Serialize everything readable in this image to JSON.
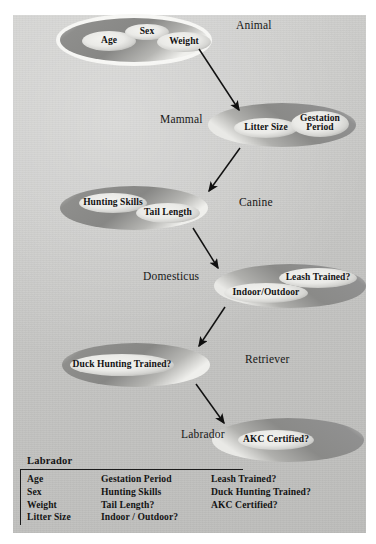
{
  "figure": {
    "background_color": "#c6c6c4",
    "panel_color": "#c9c9c7"
  },
  "classes": [
    {
      "id": "animal",
      "label": "Animal",
      "label_x": 236,
      "label_y": 19,
      "ellipse": {
        "cx": 134,
        "cy": 40,
        "rx": 74,
        "ry": 22
      },
      "has_outer_ring": true,
      "attributes": [
        {
          "name": "Age",
          "cx": 109,
          "cy": 41,
          "rx": 27,
          "ry": 10,
          "lines": [
            "Age"
          ]
        },
        {
          "name": "Sex",
          "cx": 147,
          "cy": 32,
          "rx": 22,
          "ry": 8,
          "lines": [
            "Sex"
          ]
        },
        {
          "name": "Weight",
          "cx": 184,
          "cy": 42,
          "rx": 27,
          "ry": 10,
          "lines": [
            "Weight"
          ]
        }
      ]
    },
    {
      "id": "mammal",
      "label": "Mammal",
      "label_x": 160,
      "label_y": 113,
      "ellipse": {
        "cx": 282,
        "cy": 125,
        "rx": 74,
        "ry": 22
      },
      "has_outer_ring": false,
      "attributes": [
        {
          "name": "Litter Size",
          "cx": 266,
          "cy": 128,
          "rx": 32,
          "ry": 10,
          "lines": [
            "Litter Size"
          ]
        },
        {
          "name": "Gestation Period",
          "cx": 320,
          "cy": 124,
          "rx": 29,
          "ry": 13,
          "lines": [
            "Gestation",
            "Period"
          ]
        }
      ]
    },
    {
      "id": "canine",
      "label": "Canine",
      "label_x": 239,
      "label_y": 196,
      "ellipse": {
        "cx": 134,
        "cy": 208,
        "rx": 74,
        "ry": 22
      },
      "has_outer_ring": false,
      "attributes": [
        {
          "name": "Hunting Skills",
          "cx": 113,
          "cy": 203,
          "rx": 34,
          "ry": 10,
          "lines": [
            "Hunting Skills"
          ]
        },
        {
          "name": "Tail Length",
          "cx": 168,
          "cy": 213,
          "rx": 32,
          "ry": 10,
          "lines": [
            "Tail Length"
          ]
        }
      ]
    },
    {
      "id": "domesticus",
      "label": "Domesticus",
      "label_x": 143,
      "label_y": 270,
      "ellipse": {
        "cx": 290,
        "cy": 286,
        "rx": 76,
        "ry": 22
      },
      "has_outer_ring": false,
      "attributes": [
        {
          "name": "Leash Trained?",
          "cx": 318,
          "cy": 278,
          "rx": 39,
          "ry": 10,
          "lines": [
            "Leash Trained?"
          ]
        },
        {
          "name": "Indoor/Outdoor",
          "cx": 266,
          "cy": 293,
          "rx": 42,
          "ry": 10,
          "lines": [
            "Indoor/Outdoor"
          ]
        }
      ]
    },
    {
      "id": "retriever",
      "label": "Retriever",
      "label_x": 245,
      "label_y": 353,
      "ellipse": {
        "cx": 136,
        "cy": 365,
        "rx": 74,
        "ry": 22
      },
      "has_outer_ring": false,
      "attributes": [
        {
          "name": "Duck Hunting Trained?",
          "cx": 122,
          "cy": 365,
          "rx": 52,
          "ry": 11,
          "lines": [
            "Duck Hunting Trained?"
          ]
        }
      ]
    },
    {
      "id": "labrador",
      "label": "Labrador",
      "label_x": 181,
      "label_y": 428,
      "ellipse": {
        "cx": 288,
        "cy": 440,
        "rx": 76,
        "ry": 22
      },
      "has_outer_ring": false,
      "attributes": [
        {
          "name": "AKC Certified?",
          "cx": 276,
          "cy": 440,
          "rx": 38,
          "ry": 10,
          "lines": [
            "AKC Certified?"
          ]
        }
      ]
    }
  ],
  "arrows": [
    {
      "from": "animal",
      "to": "mammal",
      "x1": 199,
      "y1": 49,
      "x2": 239,
      "y2": 110
    },
    {
      "from": "mammal",
      "to": "canine",
      "x1": 240,
      "y1": 148,
      "x2": 209,
      "y2": 191
    },
    {
      "from": "canine",
      "to": "domesticus",
      "x1": 193,
      "y1": 228,
      "x2": 218,
      "y2": 268
    },
    {
      "from": "domesticus",
      "to": "retriever",
      "x1": 225,
      "y1": 307,
      "x2": 199,
      "y2": 346
    },
    {
      "from": "retriever",
      "to": "labrador",
      "x1": 196,
      "y1": 384,
      "x2": 224,
      "y2": 423
    }
  ],
  "summary": {
    "title": "Labrador",
    "columns": [
      [
        "Age",
        "Sex",
        "Weight",
        "Litter Size"
      ],
      [
        "Gestation Period",
        "Hunting Skills",
        "Tail Length?",
        "Indoor / Outdoor?"
      ],
      [
        "Leash Trained?",
        "Duck Hunting Trained?",
        "AKC Certified?"
      ]
    ]
  }
}
